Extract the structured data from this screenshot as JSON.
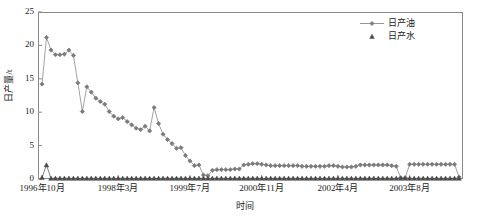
{
  "chart_data": {
    "type": "line",
    "title": "",
    "xlabel": "时间",
    "ylabel": "日产量/t",
    "ylim": [
      0,
      25
    ],
    "yticks": [
      0,
      5,
      10,
      15,
      20,
      25
    ],
    "grid": false,
    "legend_position": "top-right",
    "x_tick_labels": [
      "1996年10月",
      "1998年3月",
      "1999年7月",
      "2000年11月",
      "2002年4月",
      "2003年8月"
    ],
    "x_tick_indices": [
      0,
      17,
      33,
      49,
      66,
      82
    ],
    "n_points": 94,
    "series": [
      {
        "name": "日产油",
        "marker": "diamond",
        "color": "#7a7a7a",
        "values": [
          14.2,
          21.2,
          19.3,
          18.6,
          18.6,
          18.7,
          19.3,
          18.5,
          14.4,
          10.1,
          13.8,
          13.0,
          12.1,
          11.6,
          11.2,
          10.1,
          9.4,
          9.0,
          9.2,
          8.6,
          8.1,
          7.6,
          7.4,
          7.9,
          7.2,
          10.7,
          8.3,
          6.7,
          5.9,
          5.3,
          4.6,
          4.7,
          3.5,
          2.7,
          2.0,
          2.1,
          0.6,
          0.5,
          1.3,
          1.4,
          1.4,
          1.4,
          1.4,
          1.5,
          1.5,
          2.1,
          2.2,
          2.3,
          2.3,
          2.2,
          2.1,
          2.0,
          2.0,
          2.0,
          2.0,
          2.0,
          2.0,
          2.0,
          1.9,
          1.9,
          1.9,
          1.9,
          1.9,
          1.9,
          2.0,
          2.0,
          1.9,
          1.8,
          1.8,
          1.8,
          1.9,
          2.1,
          2.1,
          2.1,
          2.1,
          2.1,
          2.1,
          2.1,
          2.0,
          1.9,
          0.2,
          0.2,
          2.2,
          2.2,
          2.2,
          2.2,
          2.2,
          2.2,
          2.2,
          2.2,
          2.2,
          2.2,
          2.2,
          0.3
        ]
      },
      {
        "name": "日产水",
        "marker": "triangle",
        "color": "#4a4a4a",
        "values": [
          0.2,
          2.1,
          0.1,
          0.1,
          0.1,
          0.1,
          0.1,
          0.1,
          0.1,
          0.1,
          0.1,
          0.1,
          0.1,
          0.1,
          0.1,
          0.1,
          0.1,
          0.1,
          0.1,
          0.1,
          0.1,
          0.1,
          0.1,
          0.1,
          0.1,
          0.1,
          0.1,
          0.1,
          0.1,
          0.1,
          0.1,
          0.1,
          0.1,
          0.1,
          0.1,
          0.1,
          0.1,
          0.1,
          0.1,
          0.1,
          0.1,
          0.1,
          0.1,
          0.1,
          0.1,
          0.1,
          0.1,
          0.1,
          0.1,
          0.1,
          0.1,
          0.1,
          0.1,
          0.1,
          0.1,
          0.1,
          0.1,
          0.1,
          0.1,
          0.1,
          0.1,
          0.1,
          0.1,
          0.1,
          0.1,
          0.1,
          0.1,
          0.1,
          0.1,
          0.1,
          0.1,
          0.1,
          0.1,
          0.1,
          0.1,
          0.1,
          0.1,
          0.1,
          0.1,
          0.1,
          0.1,
          0.1,
          0.1,
          0.1,
          0.1,
          0.1,
          0.1,
          0.1,
          0.1,
          0.1,
          0.1,
          0.1,
          0.1,
          0.1
        ]
      }
    ]
  },
  "legend": {
    "items": [
      {
        "label": "日产油"
      },
      {
        "label": "日产水"
      }
    ]
  },
  "axes": {
    "y_title": "日产量/t",
    "x_title": "时间"
  }
}
